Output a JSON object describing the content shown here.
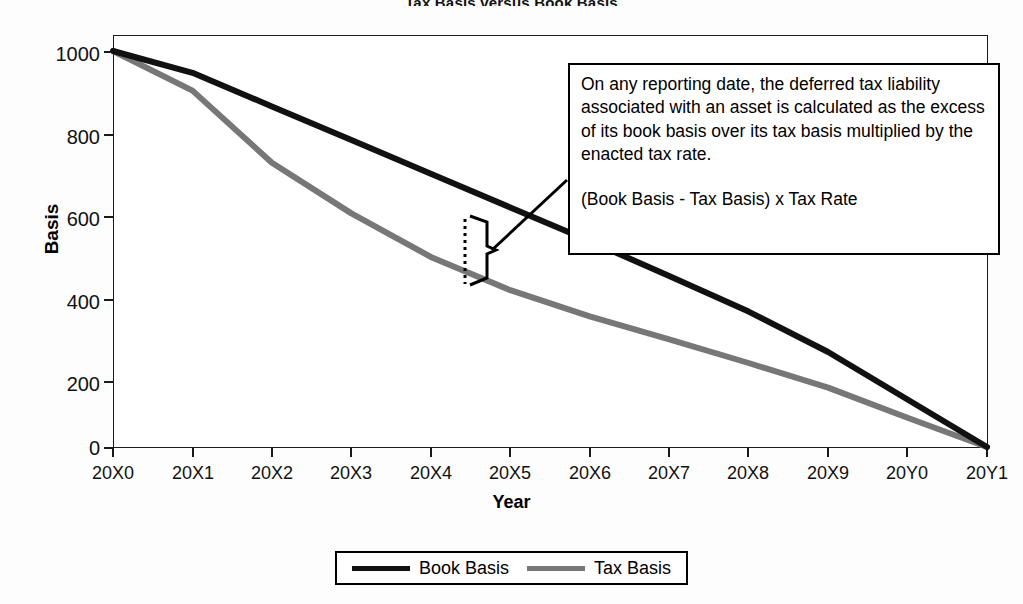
{
  "chart_data": {
    "type": "line",
    "title": "Tax Basis versus Book Basis",
    "xlabel": "Year",
    "ylabel": "Basis",
    "categories": [
      "20X0",
      "20X1",
      "20X2",
      "20X3",
      "20X4",
      "20X5",
      "20X6",
      "20X7",
      "20X8",
      "20X9",
      "20Y0",
      "20Y1"
    ],
    "ylim": [
      0,
      1000
    ],
    "yticks": [
      0,
      200,
      400,
      600,
      800,
      1000
    ],
    "ytick_labels": [
      "0",
      "200",
      "400",
      "600",
      "800",
      "1000"
    ],
    "grid": false,
    "legend_position": "bottom",
    "series": [
      {
        "name": "Book Basis",
        "color": "#111111",
        "values": [
          1000,
          945,
          860,
          775,
          690,
          605,
          520,
          432,
          342,
          240,
          120,
          0
        ]
      },
      {
        "name": "Tax Basis",
        "color": "#777777",
        "values": [
          1000,
          900,
          718,
          590,
          480,
          396,
          330,
          272,
          212,
          150,
          74,
          0
        ]
      }
    ],
    "annotations": [
      {
        "id": "deferred-tax-note",
        "paragraph": "On any reporting date, the deferred tax liability associated with an asset is calculated as the excess of its book basis over its tax basis multiplied by the enacted tax rate.",
        "formula": "(Book Basis - Tax Basis) x Tax Rate",
        "marker": "brace-between-curves-at-20X4-5"
      }
    ]
  },
  "legend": {
    "entries": [
      {
        "label": "Book Basis",
        "color": "#111111"
      },
      {
        "label": "Tax Basis",
        "color": "#777777"
      }
    ]
  }
}
